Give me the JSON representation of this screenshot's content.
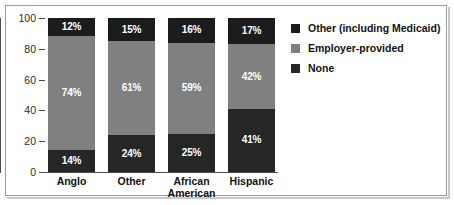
{
  "chart_data": {
    "type": "bar",
    "subtype": "stacked-100-percent",
    "title": "",
    "xlabel": "",
    "ylabel": "",
    "ylim": [
      0,
      100
    ],
    "yticks": [
      0,
      20,
      40,
      60,
      80,
      100
    ],
    "ytick_labels": [
      "0",
      "20",
      "40",
      "60",
      "80",
      "100"
    ],
    "grid": false,
    "legend_position": "right",
    "categories": [
      "Anglo",
      "Other",
      "African American",
      "Hispanic"
    ],
    "category_lines": [
      [
        "Anglo"
      ],
      [
        "Other"
      ],
      [
        "African",
        "American"
      ],
      [
        "Hispanic"
      ]
    ],
    "series": [
      {
        "name": "None",
        "color": "#262626",
        "values": [
          14,
          24,
          25,
          41
        ],
        "labels": [
          "14%",
          "24%",
          "25%",
          "41%"
        ]
      },
      {
        "name": "Employer-provided",
        "color": "#808080",
        "values": [
          74,
          61,
          59,
          42
        ],
        "labels": [
          "74%",
          "61%",
          "59%",
          "42%"
        ]
      },
      {
        "name": "Other (including Medicaid)",
        "color": "#1c1c1c",
        "values": [
          12,
          15,
          16,
          17
        ],
        "labels": [
          "12%",
          "15%",
          "16%",
          "17%"
        ]
      }
    ],
    "legend_entries": [
      {
        "label": "Other (including Medicaid)",
        "color": "#1c1c1c"
      },
      {
        "label": "Employer-provided",
        "color": "#808080"
      },
      {
        "label": "None",
        "color": "#262626"
      }
    ]
  }
}
